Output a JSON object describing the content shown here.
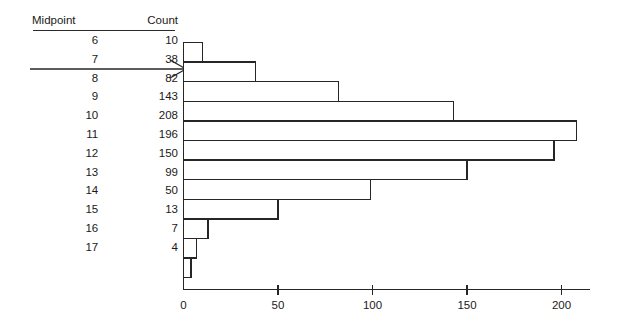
{
  "table": {
    "headers": [
      "Midpoint",
      "Count"
    ],
    "rows": [
      {
        "midpoint": "6",
        "count": "10"
      },
      {
        "midpoint": "7",
        "count": "38"
      },
      {
        "midpoint": "8",
        "count": "82"
      },
      {
        "midpoint": "9",
        "count": "143"
      },
      {
        "midpoint": "10",
        "count": "208"
      },
      {
        "midpoint": "11",
        "count": "196"
      },
      {
        "midpoint": "12",
        "count": "150"
      },
      {
        "midpoint": "13",
        "count": "99"
      },
      {
        "midpoint": "14",
        "count": "50"
      },
      {
        "midpoint": "15",
        "count": "13"
      },
      {
        "midpoint": "16",
        "count": "7"
      },
      {
        "midpoint": "17",
        "count": "4"
      }
    ]
  },
  "annotation": {
    "arrow_name": "pointer-arrow",
    "points_to_row": "7",
    "description": "arrow from table row pointing right at the corresponding histogram bar"
  },
  "chart_data": {
    "type": "bar",
    "orientation": "horizontal",
    "title": "",
    "xlabel": "",
    "ylabel": "",
    "categories": [
      "6",
      "7",
      "8",
      "9",
      "10",
      "11",
      "12",
      "13",
      "14",
      "15",
      "16",
      "17"
    ],
    "values": [
      10,
      38,
      82,
      143,
      208,
      196,
      150,
      99,
      50,
      13,
      7,
      4
    ],
    "xticks": [
      0,
      50,
      100,
      150,
      200
    ],
    "xticklabels": [
      "0",
      "50",
      "100",
      "150",
      "200"
    ],
    "xlim": [
      0,
      215
    ],
    "grid": false,
    "legend": null,
    "bar_fill": "#ffffff",
    "bar_stroke": "#262626",
    "axis_color": "#262626"
  },
  "colors": {
    "background": "#ffffff",
    "ink": "#1a1a1a",
    "line": "#262626"
  }
}
